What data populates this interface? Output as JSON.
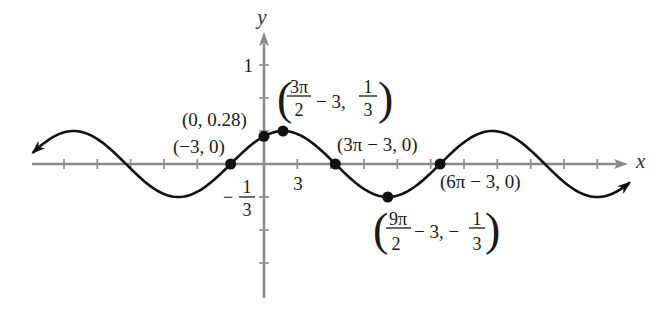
{
  "axes": {
    "x_label": "x",
    "y_label": "y",
    "y_tick_label_1": "1",
    "x_tick_label_3": "3",
    "y_tick_label_neg_third": {
      "sign": "−",
      "num": "1",
      "den": "3"
    }
  },
  "point_labels": {
    "neg3_0": "(−3, 0)",
    "zero_028": "(0, 0.28)",
    "three_pi": "(3π − 3, 0)",
    "six_pi": "(6π − 3, 0)",
    "max": {
      "open": "(",
      "num1": "3π",
      "den1": "2",
      "mid": "− 3,",
      "num2": "1",
      "den2": "3",
      "close": ")"
    },
    "min": {
      "open": "(",
      "num1": "9π",
      "den1": "2",
      "mid": "− 3, −",
      "num2": "1",
      "den2": "3",
      "close": ")"
    }
  },
  "colors": {
    "curve": "#111111",
    "axis": "#8a8a8a",
    "text": "#1a1a1a"
  },
  "chart_data": {
    "type": "line",
    "title": "",
    "function": "y = (1/3) sin((x + 3)/3)",
    "xlabel": "x",
    "ylabel": "y",
    "amplitude": 0.3333,
    "phase_shift": 3,
    "frequency_divisor": 3,
    "xlim": [
      -20.8,
      32.9
    ],
    "ylim": [
      -1.35,
      1.3
    ],
    "grid": false,
    "x_tick_step": 3,
    "x_ticks": [
      -18,
      -15,
      -12,
      -9,
      -6,
      -3,
      3,
      6,
      9,
      12,
      15,
      18,
      21,
      24,
      27,
      30
    ],
    "y_ticks": [
      -1,
      -0.6667,
      -0.3333,
      0.3333,
      0.6667,
      1
    ],
    "labeled_ticks": {
      "x": [
        3
      ],
      "y": [
        1,
        -0.3333
      ]
    },
    "key_points": [
      {
        "x": -3,
        "y": 0,
        "label": "(−3, 0)"
      },
      {
        "x": 0,
        "y": 0.28,
        "label": "(0, 0.28)"
      },
      {
        "x": 1.712,
        "y": 0.3333,
        "label": "(3π/2 − 3, 1/3)"
      },
      {
        "x": 6.425,
        "y": 0,
        "label": "(3π − 3, 0)"
      },
      {
        "x": 11.137,
        "y": -0.3333,
        "label": "(9π/2 − 3, −1/3)"
      },
      {
        "x": 15.85,
        "y": 0,
        "label": "(6π − 3, 0)"
      }
    ],
    "series": [
      {
        "name": "y = (1/3) sin((x + 3)/3)",
        "x": [
          -21,
          -18,
          -15,
          -12,
          -9,
          -6,
          -3,
          0,
          3,
          6,
          9,
          12,
          15,
          18,
          21,
          24,
          27,
          30,
          33
        ],
        "y": [
          0.093,
          0.32,
          0.252,
          -0.047,
          -0.303,
          -0.281,
          0,
          0.281,
          0.303,
          0.047,
          -0.252,
          -0.32,
          -0.093,
          0.219,
          0.33,
          0.137,
          -0.181,
          -0.333,
          -0.179
        ]
      }
    ],
    "arrows": {
      "curve_both_ends": true,
      "x_axis_positive": true,
      "y_axis_positive": true
    }
  }
}
